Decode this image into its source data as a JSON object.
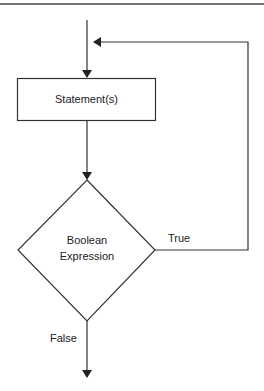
{
  "diagram": {
    "type": "flowchart",
    "title": "",
    "nodes": [
      {
        "id": "statements",
        "shape": "rectangle",
        "label": "Statement(s)"
      },
      {
        "id": "condition",
        "shape": "diamond",
        "label_line1": "Boolean",
        "label_line2": "Expression"
      }
    ],
    "edges": [
      {
        "from": "entry",
        "to": "statements",
        "label": ""
      },
      {
        "from": "statements",
        "to": "condition",
        "label": ""
      },
      {
        "from": "condition",
        "to": "statements",
        "label": "True"
      },
      {
        "from": "condition",
        "to": "exit",
        "label": "False"
      }
    ],
    "labels": {
      "true": "True",
      "false": "False"
    },
    "colors": {
      "line": "#333333",
      "background": "#ffffff"
    }
  }
}
